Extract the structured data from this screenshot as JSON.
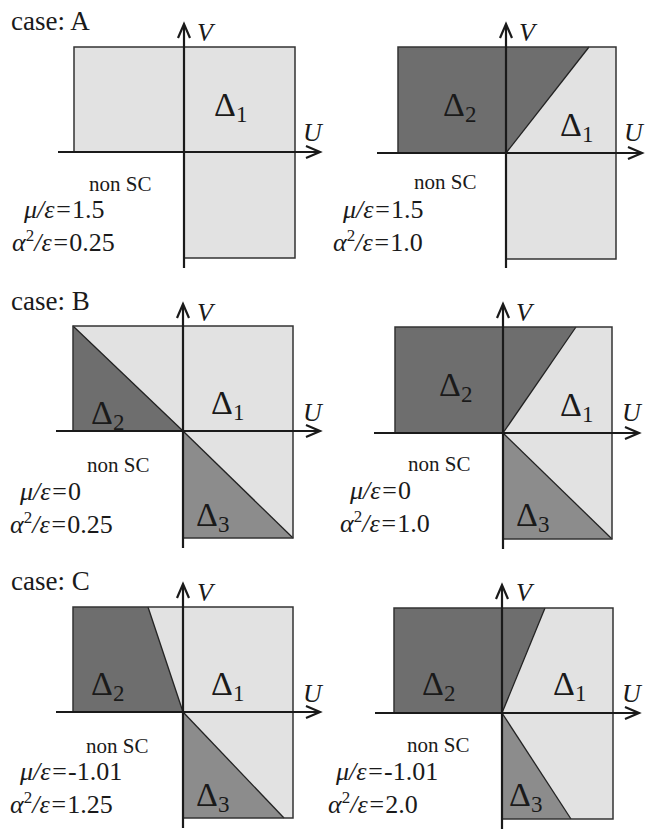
{
  "colors": {
    "delta1": "#e2e2e2",
    "delta2": "#6e6e6e",
    "delta3": "#8c8c8c",
    "line": "#1a1a1a",
    "background": "#ffffff"
  },
  "labels": {
    "axis_u": "U",
    "axis_v": "V",
    "non_sc": "non SC",
    "mu_prefix": "μ/ε=",
    "alpha_sym": "α",
    "alpha_sup": "2",
    "alpha_suffix": "/ε=",
    "delta_sym": "Δ"
  },
  "rows": [
    {
      "case_label": "case: A",
      "panels": [
        {
          "mu": "1.5",
          "alpha2": "0.25",
          "regions": [
            "Δ1"
          ]
        },
        {
          "mu": "1.5",
          "alpha2": "1.0",
          "regions": [
            "Δ1",
            "Δ2"
          ]
        }
      ]
    },
    {
      "case_label": "case: B",
      "panels": [
        {
          "mu": "0",
          "alpha2": "0.25",
          "regions": [
            "Δ1",
            "Δ2",
            "Δ3"
          ]
        },
        {
          "mu": "0",
          "alpha2": "1.0",
          "regions": [
            "Δ1",
            "Δ2",
            "Δ3"
          ]
        }
      ]
    },
    {
      "case_label": "case: C",
      "panels": [
        {
          "mu": "-1.01",
          "alpha2": "1.25",
          "regions": [
            "Δ1",
            "Δ2",
            "Δ3"
          ]
        },
        {
          "mu": "-1.01",
          "alpha2": "2.0",
          "regions": [
            "Δ1",
            "Δ2",
            "Δ3"
          ]
        }
      ]
    }
  ],
  "subscripts": {
    "one": "1",
    "two": "2",
    "three": "3"
  }
}
